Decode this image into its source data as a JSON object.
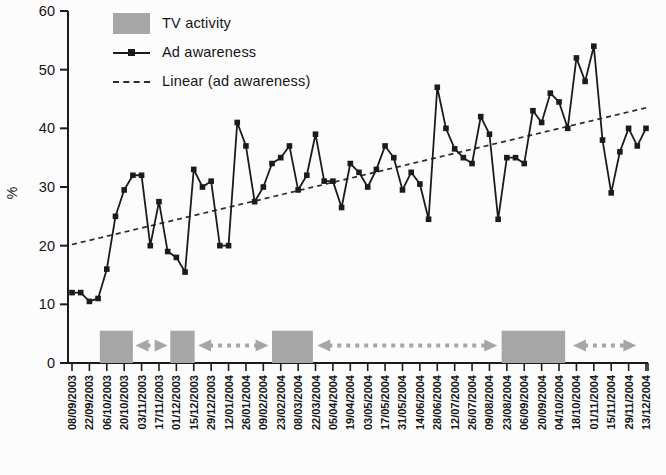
{
  "legend": {
    "items": [
      {
        "label": "TV activity",
        "swatch": "box"
      },
      {
        "label": "Ad awareness",
        "swatch": "line-marker"
      },
      {
        "label": "Linear (ad awareness)",
        "swatch": "dashed"
      }
    ]
  },
  "colors": {
    "series": "#1b1b1b",
    "trend": "#2b2b2b",
    "tv_activity": "#a6a6a6",
    "axis": "#1b1b1b",
    "text": "#151515",
    "background": "#fcfcfc"
  },
  "chart_data": {
    "type": "line",
    "title": "",
    "ylabel": "%",
    "ylim": [
      0,
      60
    ],
    "yticks": [
      0,
      10,
      20,
      30,
      40,
      50,
      60
    ],
    "grid": false,
    "legend_position": "top-left-inside",
    "x_unit": "weekly surveys, labels every 2 weeks",
    "n_points": 67,
    "x_tick_labels": [
      "08/09/2003",
      "22/09/2003",
      "06/10/2003",
      "20/10/2003",
      "03/11/2003",
      "17/11/2003",
      "01/12/2003",
      "15/12/2003",
      "29/12/2003",
      "12/01/2004",
      "26/01/2004",
      "09/02/2004",
      "23/02/2004",
      "08/03/2004",
      "22/03/2004",
      "05/04/2004",
      "19/04/2004",
      "03/05/2004",
      "17/05/2004",
      "31/05/2004",
      "14/06/2004",
      "28/06/2004",
      "12/07/2004",
      "26/07/2004",
      "09/08/2004",
      "23/08/2004",
      "06/09/2004",
      "20/09/2004",
      "04/10/2004",
      "18/10/2004",
      "01/11/2004",
      "15/11/2004",
      "29/11/2004",
      "13/12/2004"
    ],
    "series": [
      {
        "name": "Ad awareness",
        "style": "solid-line-square-markers",
        "values": [
          12,
          12,
          10.5,
          11,
          16,
          25,
          29.5,
          32,
          32,
          20,
          27.5,
          19,
          18,
          15.5,
          33,
          30,
          31,
          20,
          20,
          41,
          37,
          27.5,
          30,
          34,
          35,
          37,
          29.5,
          32,
          39,
          31,
          31,
          26.5,
          34,
          32.5,
          30,
          33,
          37,
          35,
          29.5,
          32.5,
          30.5,
          24.5,
          47,
          40,
          36.5,
          35,
          34,
          42,
          39,
          24.5,
          35,
          35,
          34,
          43,
          41,
          46,
          44.5,
          40,
          52,
          48,
          54,
          38,
          29,
          36,
          40,
          37,
          40
        ]
      },
      {
        "name": "Linear (ad awareness)",
        "style": "dashed-trend",
        "trend_start_value": 20.2,
        "trend_end_value": 43.5
      },
      {
        "name": "TV activity",
        "style": "bottom-blocks",
        "block_height_value": 5.5,
        "blocks_week_ranges": [
          {
            "from": 3.2,
            "to": 7.0
          },
          {
            "from": 11.3,
            "to": 14.1
          },
          {
            "from": 23.0,
            "to": 27.7
          },
          {
            "from": 49.4,
            "to": 56.7
          }
        ],
        "gap_arrows_week_ranges": [
          {
            "from": 7.3,
            "to": 11.0
          },
          {
            "from": 14.5,
            "to": 22.6
          },
          {
            "from": 28.2,
            "to": 48.9
          },
          {
            "from": 57.6,
            "to": 64.9
          }
        ]
      }
    ]
  }
}
